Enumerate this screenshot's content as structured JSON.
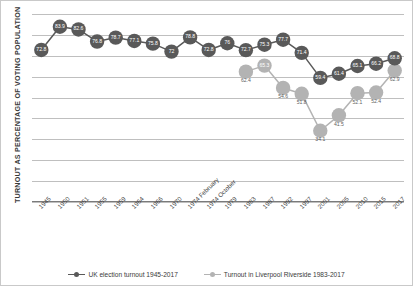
{
  "chart_data": {
    "type": "line",
    "title": "",
    "xlabel": "",
    "ylabel": "TURNOUT AS PERCENTAGE OF VOTING POPULATION",
    "ylim": [
      0,
      90
    ],
    "grid": true,
    "legend_position": "bottom",
    "categories": [
      "1945",
      "1950",
      "1951",
      "1955",
      "1959",
      "1964",
      "1966",
      "1970",
      "1974 February",
      "1974 October",
      "1979",
      "1983",
      "1987",
      "1992",
      "1997",
      "2001",
      "2005",
      "2010",
      "2015",
      "2017"
    ],
    "series": [
      {
        "name": "UK election turnout 1945-2017",
        "color": "#595959",
        "values": [
          72.8,
          83.9,
          82.6,
          76.8,
          78.7,
          77.1,
          75.8,
          72,
          78.8,
          72.8,
          76,
          72.7,
          75.3,
          77.7,
          71.4,
          59.4,
          61.4,
          65.1,
          66.2,
          68.8
        ],
        "labels": [
          "72.8",
          "83.9",
          "82.6",
          "76.8",
          "78.7",
          "77.1",
          "75.8",
          "72",
          "78.8",
          "72.8",
          "76",
          "72.7",
          "75.3",
          "77.7",
          "71.4",
          "59.4",
          "61.4",
          "65.1",
          "66.2",
          "68.8"
        ]
      },
      {
        "name": "Turnout in Liverpool Riverside 1983-2017",
        "color": "#b3b3b3",
        "values": [
          null,
          null,
          null,
          null,
          null,
          null,
          null,
          null,
          null,
          null,
          null,
          62.4,
          65.3,
          54.6,
          51.8,
          34.1,
          41.5,
          52.1,
          52.4,
          62.9
        ],
        "labels": [
          null,
          null,
          null,
          null,
          null,
          null,
          null,
          null,
          null,
          null,
          null,
          "62.4",
          "65.3",
          "54.6",
          "51.8",
          "34.1",
          "41.5",
          "52.1",
          "52.4",
          "62.9"
        ]
      }
    ]
  },
  "legend": {
    "items": [
      {
        "label": "UK election turnout 1945-2017",
        "color": "#595959"
      },
      {
        "label": "Turnout in Liverpool Riverside 1983-2017",
        "color": "#b3b3b3"
      }
    ]
  },
  "axis": {
    "y_title": "TURNOUT AS PERCENTAGE OF VOTING POPULATION",
    "gridline_count": 9
  }
}
